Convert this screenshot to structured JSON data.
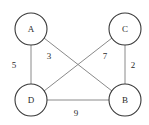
{
  "figure": {
    "title": "",
    "background_color": "#ffffff",
    "width": 149,
    "height": 125
  },
  "chart_data": {
    "type": "diagram",
    "diagram_type": "weighted-undirected-graph",
    "title": "",
    "node_radius": 16,
    "node_fill": "#ffffff",
    "node_stroke": "#3a3a3a",
    "edge_stroke": "#8a8a8a",
    "label_color": "#2b2b2b",
    "nodes": [
      {
        "id": "A",
        "label": "A",
        "x": 31,
        "y": 29
      },
      {
        "id": "C",
        "label": "C",
        "x": 125,
        "y": 29
      },
      {
        "id": "D",
        "label": "D",
        "x": 31,
        "y": 100
      },
      {
        "id": "B",
        "label": "B",
        "x": 125,
        "y": 100
      }
    ],
    "edges": [
      {
        "id": "A-D",
        "source": "A",
        "target": "D",
        "weight": 5,
        "label": "5",
        "label_x": 14,
        "label_y": 66,
        "x1": 31,
        "y1": 45,
        "x2": 31,
        "y2": 84
      },
      {
        "id": "A-B",
        "source": "A",
        "target": "B",
        "weight": 3,
        "label": "3",
        "label_x": 49,
        "label_y": 57,
        "x1": 44,
        "y1": 38,
        "x2": 112,
        "y2": 91
      },
      {
        "id": "C-D",
        "source": "C",
        "target": "D",
        "weight": 7,
        "label": "7",
        "label_x": 105,
        "label_y": 57,
        "x1": 112,
        "y1": 38,
        "x2": 44,
        "y2": 91
      },
      {
        "id": "C-B",
        "source": "C",
        "target": "B",
        "weight": 2,
        "label": "2",
        "label_x": 133,
        "label_y": 66,
        "x1": 125,
        "y1": 45,
        "x2": 125,
        "y2": 84
      },
      {
        "id": "D-B",
        "source": "D",
        "target": "B",
        "weight": 9,
        "label": "9",
        "label_x": 76,
        "label_y": 114,
        "x1": 47,
        "y1": 100,
        "x2": 109,
        "y2": 100
      }
    ]
  }
}
